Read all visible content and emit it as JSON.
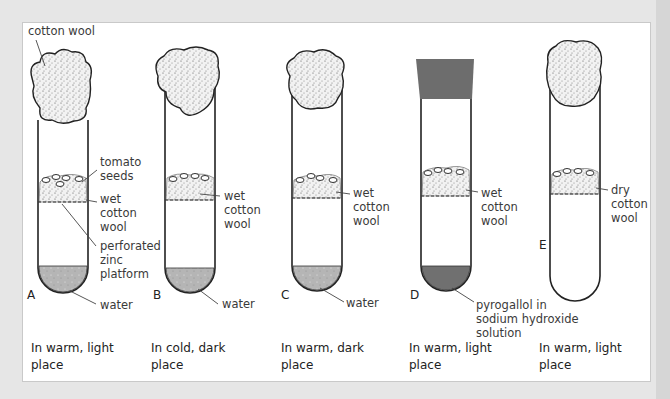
{
  "diagram": {
    "title": "",
    "tubes": [
      {
        "id": "A",
        "letter": "A",
        "top_label": "cotton wool",
        "labels": [
          "tomato\nseeds",
          "wet\ncotton\nwool",
          "perforated\nzinc\nplatform",
          "water"
        ],
        "plug": "cotton wool",
        "bottom_contents": "water",
        "caption": "In warm, light\nplace"
      },
      {
        "id": "B",
        "letter": "B",
        "labels": [
          "wet\ncotton\nwool",
          "water"
        ],
        "plug": "cotton wool",
        "bottom_contents": "water",
        "caption": "In cold, dark\nplace"
      },
      {
        "id": "C",
        "letter": "C",
        "labels": [
          "wet\ncotton\nwool",
          "water"
        ],
        "plug": "cotton wool",
        "bottom_contents": "water",
        "caption": "In warm, dark\nplace"
      },
      {
        "id": "D",
        "letter": "D",
        "labels": [
          "wet\ncotton\nwool",
          "pyrogallol in\nsodium hydroxide\nsolution"
        ],
        "plug": "rubber bung",
        "bottom_contents": "pyrogallol in sodium hydroxide solution",
        "caption": "In warm, light\nplace"
      },
      {
        "id": "E",
        "letter": "E",
        "labels": [
          "dry\ncotton\nwool"
        ],
        "plug": "cotton wool",
        "bottom_contents": "none",
        "caption": "In warm, light\nplace"
      }
    ]
  },
  "colors": {
    "background": "#e6e6e6",
    "panel": "#ffffff",
    "outline": "#222222",
    "water": "#b4b4b4",
    "pyrogallol": "#6f6f6f",
    "bung": "#6d6d6d"
  }
}
